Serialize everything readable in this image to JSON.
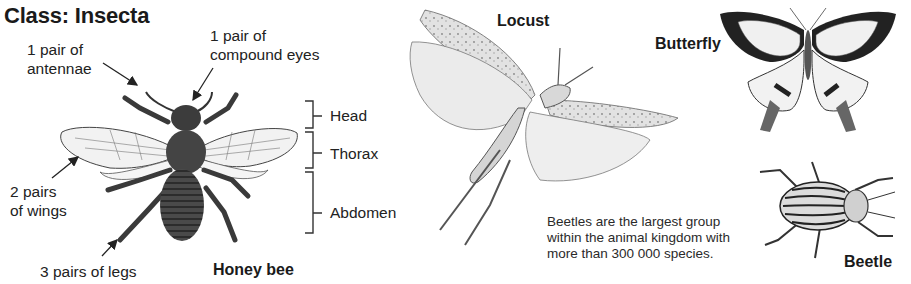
{
  "title": "Class: Insecta",
  "honey_bee": {
    "name": "Honey bee",
    "annotations": {
      "antennae": [
        "1 pair of",
        "antennae"
      ],
      "eyes": [
        "1 pair of",
        "compound eyes"
      ],
      "wings": [
        "2 pairs",
        "of wings"
      ],
      "legs": "3 pairs of legs"
    },
    "body_parts": [
      "Head",
      "Thorax",
      "Abdomen"
    ]
  },
  "locust": {
    "name": "Locust"
  },
  "butterfly": {
    "name": "Butterfly"
  },
  "beetle": {
    "name": "Beetle",
    "fact": [
      "Beetles are the largest group",
      "within the animal kingdom with",
      "more than 300 000 species."
    ]
  },
  "colors": {
    "text": "#1a1a1a",
    "ink": "#2b2b2b",
    "wing_fill": "#ececec",
    "body_dark": "#3a3a3a"
  }
}
